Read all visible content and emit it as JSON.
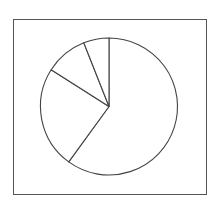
{
  "chart_data": {
    "type": "pie",
    "title": "",
    "start_angle": "12 o'clock",
    "direction": "clockwise",
    "slices": [
      {
        "label": "",
        "value": 60
      },
      {
        "label": "",
        "value": 24
      },
      {
        "label": "",
        "value": 10
      },
      {
        "label": "",
        "value": 6
      }
    ],
    "legend": "none",
    "frame": true
  },
  "colors": {
    "stroke": "#444444",
    "fill": "#ffffff",
    "frame": "#555555"
  }
}
